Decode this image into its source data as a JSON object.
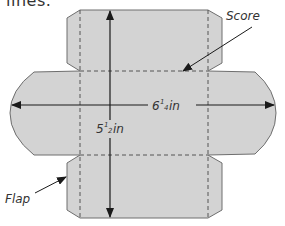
{
  "intro_text_fragment": "lines.",
  "labels": {
    "score": "Score",
    "flap": "Flap",
    "width_whole": "6",
    "width_num": "1",
    "width_den": "4",
    "width_unit": "in",
    "height_whole": "5",
    "height_num": "1",
    "height_den": "2",
    "height_unit": "in"
  },
  "dimensions": {
    "width": "6 1/4 in",
    "height": "5 1/2 in"
  },
  "colors": {
    "fill": "#d3d3d3",
    "outline": "#6e6e6e",
    "dash": "#555555",
    "arrow": "#1a1a1a",
    "text": "#333333"
  }
}
